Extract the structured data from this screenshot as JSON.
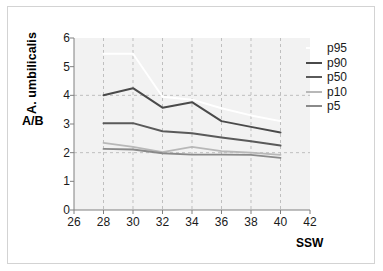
{
  "chart_data": {
    "type": "line",
    "title": "",
    "subtitle": "",
    "xlabel": "SSW",
    "ylabel": "A. umbilicalis",
    "ylabel_secondary": "A/B",
    "xlim": [
      26,
      42
    ],
    "ylim": [
      0,
      6
    ],
    "xticks": [
      26,
      28,
      30,
      32,
      34,
      36,
      38,
      40,
      42
    ],
    "yticks": [
      0,
      1,
      2,
      3,
      4,
      5,
      6
    ],
    "xtick_labels": [
      "26",
      "28",
      "30",
      "32",
      "34",
      "36",
      "38",
      "40",
      "42"
    ],
    "ytick_labels": [
      "0",
      "1",
      "2",
      "3",
      "4",
      "5",
      "6"
    ],
    "grid": true,
    "grid_style": "dashed",
    "grid_x_values": [
      28,
      30,
      32,
      34,
      36,
      38,
      40
    ],
    "grid_y_values": [
      2,
      4
    ],
    "legend_position": "right",
    "plot_background": "#f2f2f2",
    "x": [
      28,
      30,
      32,
      34,
      36,
      38,
      40
    ],
    "series": [
      {
        "name": "p95",
        "color": "#ffffff",
        "width": 2.0,
        "values": [
          5.45,
          5.45,
          3.95,
          3.85,
          3.55,
          3.3,
          3.1
        ]
      },
      {
        "name": "p90",
        "color": "#4a4a4a",
        "width": 2.0,
        "values": [
          4.0,
          4.25,
          3.57,
          3.76,
          3.1,
          2.9,
          2.7
        ]
      },
      {
        "name": "p50",
        "color": "#5a5a5a",
        "width": 2.0,
        "values": [
          3.03,
          3.03,
          2.75,
          2.68,
          2.53,
          2.4,
          2.25
        ]
      },
      {
        "name": "p10",
        "color": "#b8b8b8",
        "width": 1.8,
        "values": [
          2.34,
          2.2,
          2.02,
          2.2,
          2.05,
          2.0,
          1.92
        ]
      },
      {
        "name": "p5",
        "color": "#8a8a8a",
        "width": 1.8,
        "values": [
          2.13,
          2.11,
          1.98,
          1.93,
          1.93,
          1.92,
          1.82
        ]
      }
    ]
  },
  "legend": {
    "entries": [
      {
        "label": "p95",
        "color": "#ffffff"
      },
      {
        "label": "p90",
        "color": "#4a4a4a"
      },
      {
        "label": "p50",
        "color": "#5a5a5a"
      },
      {
        "label": "p10",
        "color": "#b8b8b8"
      },
      {
        "label": "p5",
        "color": "#8a8a8a"
      }
    ]
  },
  "axes": {
    "y_title": "A. umbilicalis",
    "y_ratio_label": "A/B",
    "x_title": "SSW"
  },
  "colors": {
    "axis": "#808080",
    "grid": "#bfbfbf",
    "plot_bg": "#f2f2f2",
    "frame": "#d3d3d3",
    "text": "#1a1a1a"
  }
}
